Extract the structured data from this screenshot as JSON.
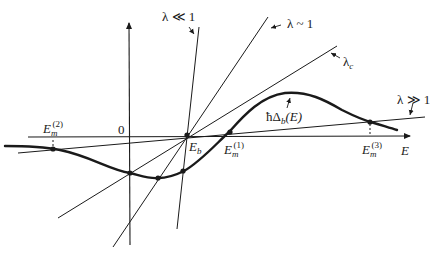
{
  "figure": {
    "type": "graphical-solution-diagram",
    "axis": {
      "horizontal_label": "E",
      "origin_label": "0"
    },
    "curve": {
      "label": "ħΔ",
      "label_sub": "b",
      "label_arg": "(E)"
    },
    "point_labels": {
      "Eb": {
        "main": "E",
        "sub": "b"
      },
      "Em1": {
        "main": "E",
        "sub": "m",
        "sup": "(1)"
      },
      "Em2": {
        "main": "E",
        "sub": "m",
        "sup": "(2)"
      },
      "Em3": {
        "main": "E",
        "sub": "m",
        "sup": "(3)"
      }
    },
    "lines": [
      {
        "id": "lambda-much-less-1",
        "label": "λ ≪ 1"
      },
      {
        "id": "lambda-approx-1",
        "label": "λ ~ 1"
      },
      {
        "id": "lambda-critical",
        "label": "λ",
        "label_sub": "c"
      },
      {
        "id": "lambda-much-greater-1",
        "label": "λ ≫ 1"
      }
    ],
    "colors": {
      "ink": "#1a1a1a",
      "background": "#ffffff"
    }
  }
}
